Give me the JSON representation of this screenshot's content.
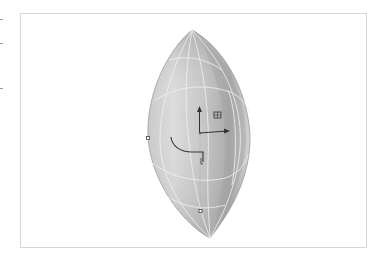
{
  "viewport": {
    "name": "3D perspective viewport",
    "object": "lens-shaped surface",
    "display_mode": "shaded with isoparm wireframe"
  },
  "gizmo": {
    "type": "transform manipulator",
    "handles": [
      "y-axis-arrow",
      "x-axis-arrow",
      "plane-handle",
      "rotate-arc",
      "pivot-point"
    ]
  },
  "colors": {
    "background": "#ffffff",
    "viewport_border": "#d6d6d6",
    "surface_light": "#e6e6e6",
    "surface_mid": "#bdbdbd",
    "surface_dark": "#8f8f8f",
    "isoparm": "#f2f2f2",
    "gizmo": "#333333"
  }
}
